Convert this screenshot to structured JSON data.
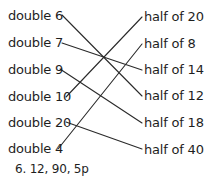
{
  "left_items": [
    {
      "label": "double 6"
    },
    {
      "label": "double 7"
    },
    {
      "label": "double 9"
    },
    {
      "label": "double 10"
    },
    {
      "label": "double 20"
    },
    {
      "label": "double 4"
    }
  ],
  "right_items": [
    {
      "label": "half of 20"
    },
    {
      "label": "half of 8"
    },
    {
      "label": "half of 14"
    },
    {
      "label": "half of 12"
    },
    {
      "label": "half of 18"
    },
    {
      "label": "half of 40"
    }
  ],
  "connections": [
    {
      "from": "double 6",
      "to": "half of 12"
    },
    {
      "from": "double 7",
      "to": "half of 14"
    },
    {
      "from": "double 9",
      "to": "half of 18"
    },
    {
      "from": "double 10",
      "to": "half of 20"
    },
    {
      "from": "double 20",
      "to": "half of 40"
    },
    {
      "from": "double 4",
      "to": "half of 8"
    }
  ],
  "footer": {
    "text": "6. 12, 90, 5p"
  }
}
